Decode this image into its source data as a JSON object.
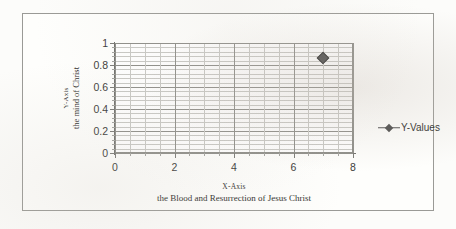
{
  "chart_data": {
    "type": "scatter",
    "title": "",
    "xlabel": "X-Axis",
    "xlabel_sub": "the Blood and Resurrection of Jesus Christ",
    "ylabel": "Y-Axis",
    "ylabel_sub": "the mind of Christ",
    "xlim": [
      0,
      8
    ],
    "ylim": [
      0,
      1
    ],
    "x_ticks": [
      "0",
      "2",
      "4",
      "6",
      "8"
    ],
    "x_tick_values": [
      0,
      2,
      4,
      6,
      8
    ],
    "y_ticks": [
      "0",
      "0.2",
      "0.4",
      "0.6",
      "0.8",
      "1"
    ],
    "y_tick_values": [
      0,
      0.2,
      0.4,
      0.6,
      0.8,
      1
    ],
    "x_minor_step": 0.5,
    "y_minor_step": 0.04,
    "grid": true,
    "legend_position": "right",
    "series": [
      {
        "name": "Y-Values",
        "marker": "diamond",
        "color": "#4b4b4b",
        "x": [
          7
        ],
        "y": [
          0.86
        ],
        "points": [
          {
            "x": 7,
            "y": 0.86
          }
        ]
      }
    ]
  },
  "legend": {
    "entries": [
      {
        "label": "Y-Values",
        "marker": "diamond-line-marker"
      }
    ]
  },
  "colors": {
    "marker": "#4b4b4b",
    "grid_major": "#8d8d88",
    "grid_minor": "#c8c8c4",
    "axis": "#6f6f6b",
    "frame": "#9a9a96",
    "text": "#2e2e2c",
    "background": "#fcfcfa"
  }
}
